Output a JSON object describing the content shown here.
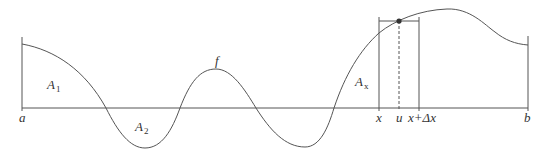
{
  "diagram": {
    "colors": {
      "line": "#555555",
      "text": "#333333",
      "background": "#ffffff"
    },
    "labels": {
      "a": "a",
      "b": "b",
      "f": "f",
      "x": "x",
      "u": "u",
      "x_plus_dx": "x+Δx",
      "A1_main": "A",
      "A1_sub": "1",
      "A2_main": "A",
      "A2_sub": "2",
      "Ax_main": "A",
      "Ax_sub": "x"
    }
  }
}
